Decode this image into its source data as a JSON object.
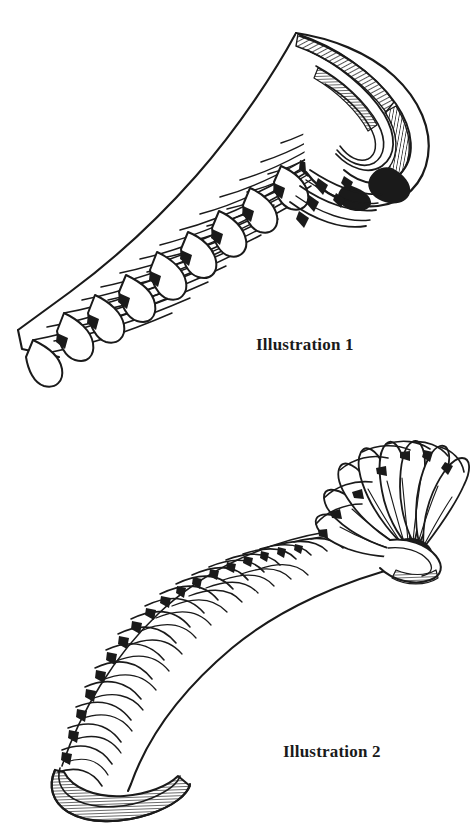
{
  "page": {
    "background_color": "#ffffff",
    "ink_color": "#1a1a1a",
    "width": 473,
    "height": 832,
    "medium": "pen-and-ink line drawing"
  },
  "figures": [
    {
      "id": "illustration-1",
      "caption": "Illustration 1",
      "caption_position": {
        "x": 256,
        "y": 336
      },
      "description": "Elongated ribbed band curving from lower left to upper right, terminating in a tightly rolled spiral at the upper right end",
      "orientation": "lower-left to upper-right",
      "rib_count": 26,
      "end_detail": "rolled spiral with hatched inner surface"
    },
    {
      "id": "illustration-2",
      "caption": "Illustration 2",
      "caption_position": {
        "x": 283,
        "y": 743
      },
      "description": "Curved ribbed band arcing from lower left upward to the right, opening into a spread fan of plates radiating from a dark round pivot",
      "orientation": "lower-left arcing to upper-right",
      "rib_count": 28,
      "end_detail": "spread fan of radiating blades around a solid dark hub"
    }
  ],
  "captions": {
    "illustration_1": "Illustration 1",
    "illustration_2": "Illustration 2"
  }
}
